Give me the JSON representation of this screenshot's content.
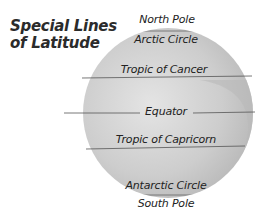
{
  "title": {
    "line1": "Special Lines",
    "line2": "of Latitude"
  },
  "labels": {
    "north_pole": "North Pole",
    "arctic_circle": "Arctic Circle",
    "tropic_of_cancer": "Tropic of Cancer",
    "equator": "Equator",
    "tropic_of_capricorn": "Tropic of Capricorn",
    "antarctic_circle": "Antarctic Circle",
    "south_pole": "South Pole"
  },
  "colors": {
    "globe": "#c9c9c9",
    "land": "#b5b5b5",
    "line": "#555555",
    "text": "#222222"
  }
}
